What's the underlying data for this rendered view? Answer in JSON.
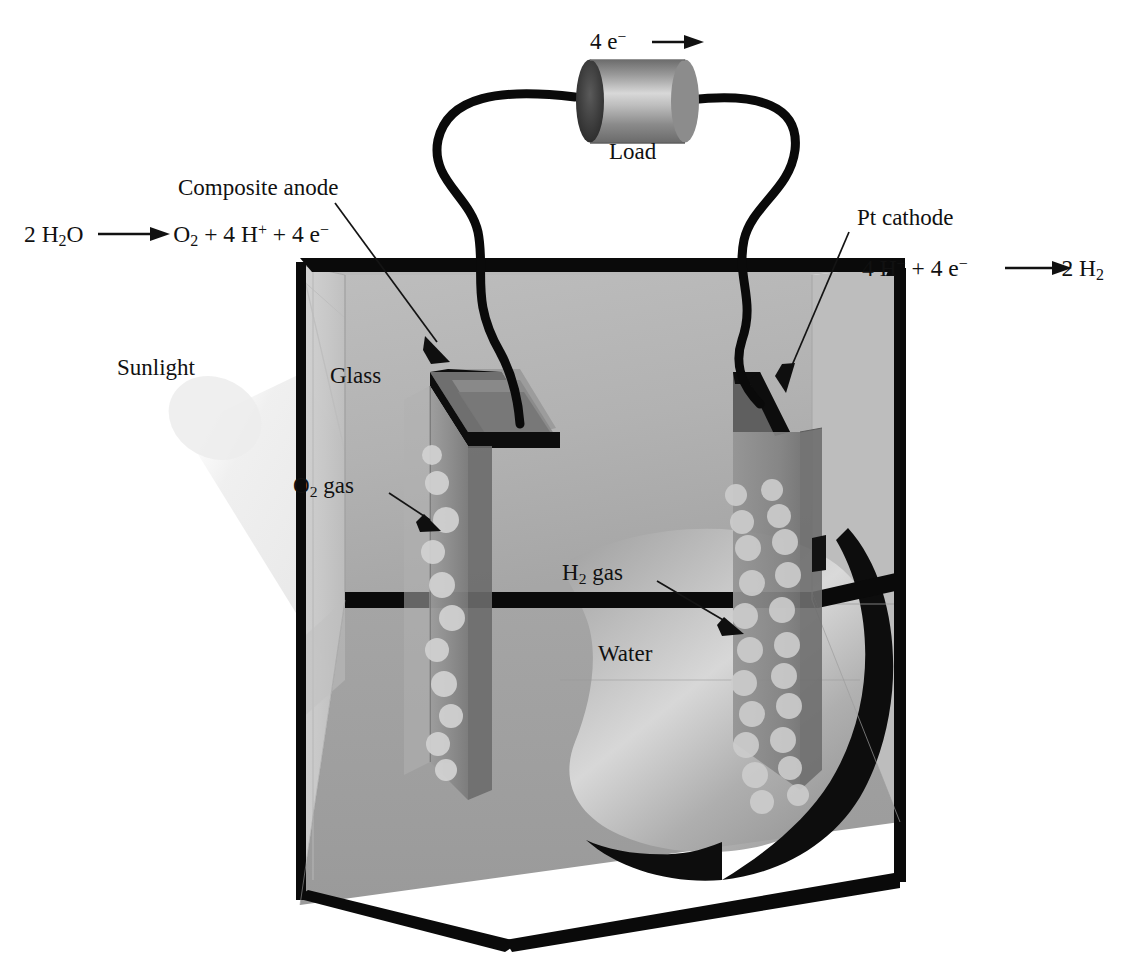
{
  "diagram": {
    "title_context": "Photoelectrochemical water-splitting cell",
    "labels": {
      "electron_flow": "4 e",
      "electron_flow_sup": "−",
      "electron_flow_arrow": "→",
      "load": "Load",
      "composite_anode": "Composite anode",
      "pt_cathode": "Pt cathode",
      "sunlight": "Sunlight",
      "glass": "Glass",
      "water": "Water",
      "o2_gas_pre": "O",
      "o2_gas_sub": "2",
      "o2_gas_post": " gas",
      "h2_gas_pre": "H",
      "h2_gas_sub": "2",
      "h2_gas_post": " gas"
    },
    "equations": {
      "anode": {
        "reactant_num": "2",
        "reactant": "H₂O",
        "arrow": "⟶",
        "products": "O₂ + 4 H⁺ + 4 e⁻",
        "full": "2 H2O ⟶ O2 + 4 H+ + 4 e−"
      },
      "cathode": {
        "reactants": "4 H⁺ + 4 e⁻",
        "arrow": "⟶",
        "products_num": "2",
        "products": "H₂",
        "full": "4 H+ + 4 e− ⟶ 2 H2"
      }
    },
    "colors": {
      "ink": "#111111",
      "tank_edge": "#0a0a0a",
      "back_wall": "#b4b4b4",
      "left_glass": "#c9c9c9",
      "floor": "#a9a9a9",
      "water_body": "#979797",
      "anode_plate": "#8e8e8e",
      "cathode_plate": "#8a8a8a",
      "bubble": "#cfcfcf",
      "load_body": "#8f8f8f",
      "load_cap": "#3a3a3a",
      "sunlight": "#e8e8e8"
    },
    "bubbles": {
      "o2_count": 11,
      "h2_count": 22,
      "o2_note": "single wavy column along composite anode front face",
      "h2_note": "two staggered columns on Pt cathode plate"
    },
    "components": [
      {
        "name": "composite-anode",
        "side": "left",
        "role": "oxidation / O2 evolution"
      },
      {
        "name": "pt-cathode",
        "side": "right",
        "role": "reduction / H2 evolution"
      },
      {
        "name": "load",
        "role": "external circuit resistor"
      },
      {
        "name": "glass-tank",
        "role": "electrolyte container"
      }
    ]
  }
}
